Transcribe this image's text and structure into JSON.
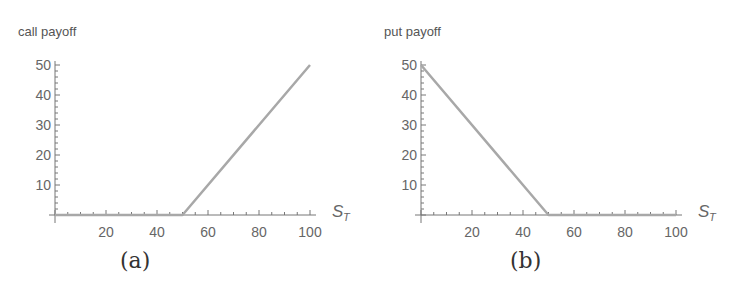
{
  "chart_data": [
    {
      "type": "line",
      "title": "call payoff",
      "ylabel": "call payoff",
      "xlabel": "S_T",
      "caption": "(a)",
      "x": [
        0,
        50,
        100
      ],
      "series": [
        {
          "name": "call payoff",
          "values": [
            0,
            0,
            50
          ]
        }
      ],
      "xlim": [
        0,
        100
      ],
      "ylim": [
        0,
        50
      ],
      "xticks": [
        20,
        40,
        60,
        80,
        100
      ],
      "yticks": [
        10,
        20,
        30,
        40,
        50
      ],
      "grid": false,
      "line_color": "#a8a8a8"
    },
    {
      "type": "line",
      "title": "put payoff",
      "ylabel": "put payoff",
      "xlabel": "S_T",
      "caption": "(b)",
      "x": [
        0,
        50,
        100
      ],
      "series": [
        {
          "name": "put payoff",
          "values": [
            50,
            0,
            0
          ]
        }
      ],
      "xlim": [
        0,
        100
      ],
      "ylim": [
        0,
        50
      ],
      "xticks": [
        20,
        40,
        60,
        80,
        100
      ],
      "yticks": [
        10,
        20,
        30,
        40,
        50
      ],
      "grid": false,
      "line_color": "#a8a8a8"
    }
  ],
  "panels": {
    "a": {
      "ylabel": "call payoff",
      "caption": "(a)",
      "xaxis_label": "S",
      "xaxis_sub": "T",
      "xticks": [
        "20",
        "40",
        "60",
        "80",
        "100"
      ],
      "yticks": [
        "10",
        "20",
        "30",
        "40",
        "50"
      ]
    },
    "b": {
      "ylabel": "put payoff",
      "caption": "(b)",
      "xaxis_label": "S",
      "xaxis_sub": "T",
      "xticks": [
        "20",
        "40",
        "60",
        "80",
        "100"
      ],
      "yticks": [
        "10",
        "20",
        "30",
        "40",
        "50"
      ]
    }
  }
}
